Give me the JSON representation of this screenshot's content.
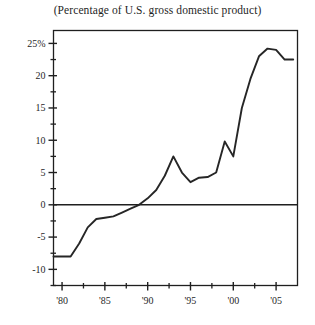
{
  "chart_data": {
    "type": "line",
    "title": "(Percentage of U.S. gross domestic product)",
    "xlabel": "",
    "ylabel": "",
    "xlim": [
      1979,
      2007.5
    ],
    "ylim": [
      -12.5,
      27
    ],
    "grid": false,
    "legend": null,
    "y_ticks": [
      {
        "value": 25,
        "label": "25%"
      },
      {
        "value": 20,
        "label": "20"
      },
      {
        "value": 15,
        "label": "15"
      },
      {
        "value": 10,
        "label": "10"
      },
      {
        "value": 5,
        "label": "5"
      },
      {
        "value": 0,
        "label": "0"
      },
      {
        "value": -5,
        "label": "-5"
      },
      {
        "value": -10,
        "label": "-10"
      }
    ],
    "y_minor_ticks": [
      22.5,
      17.5,
      12.5,
      7.5,
      2.5,
      -2.5,
      -7.5,
      -12.5
    ],
    "x_ticks": [
      {
        "value": 1980,
        "label": "'80"
      },
      {
        "value": 1985,
        "label": "'85"
      },
      {
        "value": 1990,
        "label": "'90"
      },
      {
        "value": 1995,
        "label": "'95"
      },
      {
        "value": 2000,
        "label": "'00"
      },
      {
        "value": 2005,
        "label": "'05"
      }
    ],
    "x_minor_ticks": [
      1982.5,
      1987.5,
      1992.5,
      1997.5,
      2002.5
    ],
    "zero_line": 0,
    "series": [
      {
        "name": "Net international investment position",
        "color": "#262626",
        "x": [
          1979,
          1980,
          1981,
          1982,
          1983,
          1984,
          1985,
          1986,
          1987,
          1988,
          1989,
          1990,
          1991,
          1992,
          1993,
          1994,
          1995,
          1996,
          1997,
          1998,
          1999,
          2000,
          2001,
          2002,
          2003,
          2004,
          2005,
          2006,
          2007
        ],
        "values": [
          -8.0,
          -8.0,
          -8.0,
          -6.0,
          -3.5,
          -2.2,
          -2.0,
          -1.8,
          -1.2,
          -0.6,
          0.0,
          1.0,
          2.3,
          4.5,
          7.5,
          5.0,
          3.5,
          4.2,
          4.3,
          5.0,
          9.8,
          7.5,
          15.0,
          19.5,
          23.0,
          24.2,
          24.0,
          22.5,
          22.5
        ]
      }
    ]
  }
}
